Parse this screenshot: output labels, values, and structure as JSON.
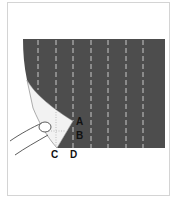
{
  "figure": {
    "colors": {
      "fabric": "#4d4d4d",
      "stripe": "#e8e8e8",
      "underside": "#f2f2f2",
      "border": "#d4d4d4"
    },
    "labels": {
      "a": "A",
      "b": "B",
      "c": "C",
      "d": "D"
    }
  }
}
